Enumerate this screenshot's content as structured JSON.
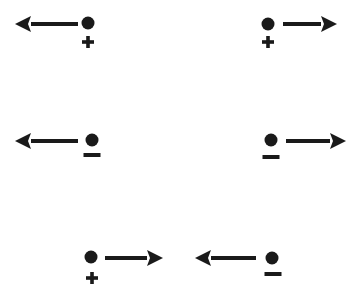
{
  "diagram": {
    "title": "Charged particles and their direction of motion",
    "ink_color": "#1a1a1a",
    "background": "#ffffff",
    "rows": [
      {
        "id": "row-positive",
        "description": "Positive charges moving in opposite directions",
        "items": [
          {
            "charge": "+",
            "charge_label": "positive",
            "arrow_direction": "left",
            "circle": {
              "cx": 88,
              "cy": 23
            },
            "sign": {
              "cx": 88,
              "cy": 42
            },
            "arrow": {
              "tail_x": 78,
              "tip_x": 15,
              "y": 24
            }
          },
          {
            "charge": "+",
            "charge_label": "positive",
            "arrow_direction": "right",
            "circle": {
              "cx": 268,
              "cy": 24
            },
            "sign": {
              "cx": 268,
              "cy": 42
            },
            "arrow": {
              "tail_x": 283,
              "tip_x": 337,
              "y": 24
            }
          }
        ]
      },
      {
        "id": "row-negative",
        "description": "Negative charges moving in opposite directions",
        "items": [
          {
            "charge": "−",
            "charge_label": "negative",
            "arrow_direction": "left",
            "circle": {
              "cx": 92,
              "cy": 140
            },
            "sign": {
              "cx": 92,
              "cy": 155
            },
            "arrow": {
              "tail_x": 78,
              "tip_x": 15,
              "y": 141
            }
          },
          {
            "charge": "−",
            "charge_label": "negative",
            "arrow_direction": "right",
            "circle": {
              "cx": 271,
              "cy": 140
            },
            "sign": {
              "cx": 271,
              "cy": 157
            },
            "arrow": {
              "tail_x": 286,
              "tip_x": 346,
              "y": 141
            }
          }
        ]
      },
      {
        "id": "row-mixed",
        "description": "Positive and negative charges moving toward each other",
        "items": [
          {
            "charge": "+",
            "charge_label": "positive",
            "arrow_direction": "right",
            "circle": {
              "cx": 91,
              "cy": 257
            },
            "sign": {
              "cx": 92,
              "cy": 278
            },
            "arrow": {
              "tail_x": 105,
              "tip_x": 163,
              "y": 258
            }
          },
          {
            "charge": "−",
            "charge_label": "negative",
            "arrow_direction": "left",
            "circle": {
              "cx": 272,
              "cy": 258
            },
            "sign": {
              "cx": 273,
              "cy": 274
            },
            "arrow": {
              "tail_x": 256,
              "tip_x": 195,
              "y": 258
            }
          }
        ]
      }
    ]
  }
}
